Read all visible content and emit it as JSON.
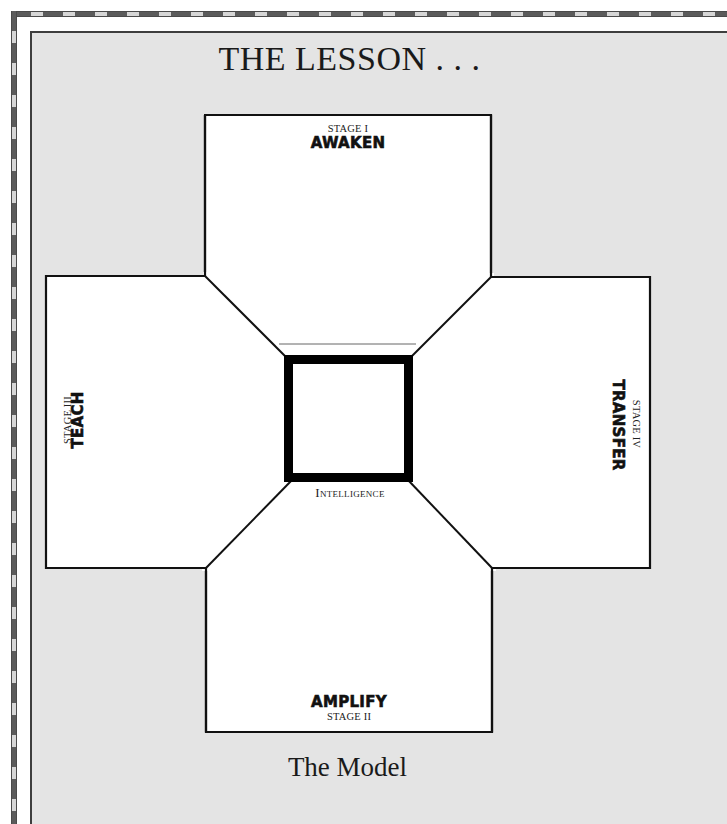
{
  "title": "THE LESSON . . .",
  "caption": "The Model",
  "center": {
    "label": "Intelligence"
  },
  "stages": {
    "top": {
      "stage": "STAGE I",
      "name": "AWAKEN"
    },
    "bottom": {
      "stage": "STAGE II",
      "name": "AMPLIFY"
    },
    "left": {
      "stage": "STAGE III",
      "name": "TEACH"
    },
    "right": {
      "stage": "STAGE IV",
      "name": "TRANSFER"
    }
  },
  "colors": {
    "panel_background": "#e4e4e4",
    "box_fill": "#ffffff",
    "stroke": "#111111",
    "frame": "#5b5b5b"
  }
}
